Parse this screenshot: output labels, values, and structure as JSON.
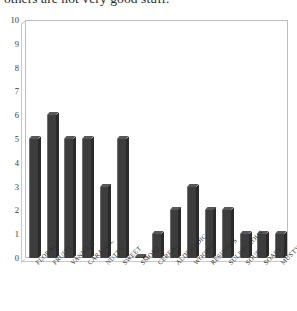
{
  "top_text": {
    "clipped_line": "others are not very good stuff."
  },
  "chart_data": {
    "type": "bar",
    "title": "",
    "subtitle": "",
    "xlabel": "",
    "ylabel": "",
    "ylim": [
      0,
      10
    ],
    "ytick_labels": [
      "10",
      "9",
      "8",
      "7",
      "6",
      "5",
      "4",
      "3",
      "2",
      "1",
      "0"
    ],
    "ytick_values": [
      10,
      9,
      8,
      7,
      6,
      5,
      4,
      3,
      2,
      1,
      0
    ],
    "grid": false,
    "legend": "none",
    "bar_style": "3d-column",
    "bar_color": "#3d3d3d",
    "plot_border_color": "#bdbdbd",
    "categories": [
      "FLORAL",
      "FRUITY",
      "VANILLA",
      "CARAMEL",
      "NUTTY",
      "SWEET",
      "SMOKY",
      "CEREAL",
      "ALDEHYDIC",
      "WOODY",
      "RESINOUS",
      "SULPHUROUS",
      "SOUR",
      "SOAPY",
      "MUSTY"
    ],
    "values": [
      5,
      6,
      5,
      5,
      3,
      5,
      0,
      1,
      2,
      3,
      2,
      2,
      1,
      1,
      1
    ]
  }
}
